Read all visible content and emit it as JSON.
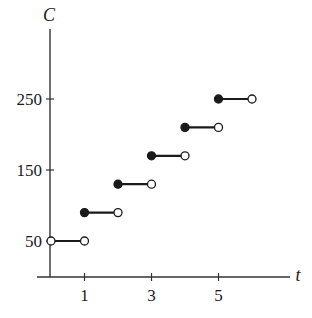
{
  "chart_data": {
    "type": "line",
    "subtype": "step",
    "title": "",
    "xlabel": "t",
    "ylabel": "C",
    "x_ticks": [
      1,
      3,
      5
    ],
    "y_ticks": [
      50,
      150,
      250
    ],
    "x_tick_labels": [
      "1",
      "3",
      "5"
    ],
    "y_tick_labels": [
      "50",
      "150",
      "250"
    ],
    "xlim": [
      0,
      6
    ],
    "ylim": [
      0,
      250
    ],
    "grid": false,
    "legend": null,
    "segments": [
      {
        "x_start": 0,
        "x_end": 1,
        "value": 50,
        "start_closed": false,
        "end_closed": false
      },
      {
        "x_start": 1,
        "x_end": 2,
        "value": 90,
        "start_closed": true,
        "end_closed": false
      },
      {
        "x_start": 2,
        "x_end": 3,
        "value": 130,
        "start_closed": true,
        "end_closed": false
      },
      {
        "x_start": 3,
        "x_end": 4,
        "value": 170,
        "start_closed": true,
        "end_closed": false
      },
      {
        "x_start": 4,
        "x_end": 5,
        "value": 210,
        "start_closed": true,
        "end_closed": false
      },
      {
        "x_start": 5,
        "x_end": 6,
        "value": 250,
        "start_closed": true,
        "end_closed": false
      }
    ],
    "colors": {
      "line": "#1a1a1a",
      "axis": "#333333",
      "open_fill": "#ffffff"
    }
  }
}
